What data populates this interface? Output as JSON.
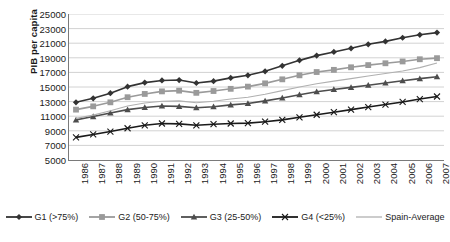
{
  "chart_data": {
    "type": "line",
    "title": "",
    "xlabel": "",
    "ylabel": "PIB per capita",
    "ylim": [
      5000,
      25000
    ],
    "ytick_step": 2000,
    "yticks": [
      5000,
      7000,
      9000,
      11000,
      13000,
      15000,
      17000,
      19000,
      21000,
      23000,
      25000
    ],
    "grid": true,
    "legend_position": "bottom",
    "categories": [
      "1986",
      "1987",
      "1988",
      "1989",
      "1990",
      "1991",
      "1992",
      "1993",
      "1994",
      "1995",
      "1996",
      "1997",
      "1998",
      "1999",
      "2000",
      "2001",
      "2002",
      "2003",
      "2004",
      "2005",
      "2006",
      "2007"
    ],
    "series": [
      {
        "name": "G1 (>75%)",
        "marker": "diamond",
        "color": "#333333",
        "values": [
          12900,
          13450,
          14150,
          15050,
          15600,
          15900,
          15950,
          15550,
          15800,
          16250,
          16600,
          17150,
          17900,
          18650,
          19300,
          19800,
          20300,
          20850,
          21250,
          21750,
          22150,
          22450
        ]
      },
      {
        "name": "G2 (50-75%)",
        "marker": "square",
        "color": "#9a9a9a",
        "values": [
          11900,
          12350,
          12900,
          13600,
          14050,
          14400,
          14500,
          14200,
          14450,
          14750,
          15050,
          15500,
          16050,
          16600,
          17050,
          17350,
          17700,
          18000,
          18250,
          18500,
          18800,
          18950
        ]
      },
      {
        "name": "G3 (25-50%)",
        "marker": "triangle",
        "color": "#4d4d4d",
        "values": [
          10500,
          10950,
          11450,
          11900,
          12200,
          12400,
          12350,
          12150,
          12300,
          12550,
          12750,
          13100,
          13500,
          13950,
          14350,
          14650,
          14950,
          15250,
          15550,
          15850,
          16150,
          16400
        ]
      },
      {
        "name": "G4 (<25%)",
        "marker": "cross",
        "color": "#1a1a1a",
        "values": [
          8100,
          8500,
          8900,
          9350,
          9750,
          10000,
          9950,
          9750,
          9900,
          10000,
          10050,
          10250,
          10500,
          10850,
          11200,
          11550,
          11900,
          12250,
          12600,
          12950,
          13350,
          13700
        ]
      },
      {
        "name": "Spain-Average",
        "marker": "none",
        "color": "#b0b0b0",
        "values": [
          10700,
          11150,
          11750,
          12400,
          12800,
          13050,
          13100,
          12850,
          13050,
          13350,
          13600,
          14000,
          14500,
          15000,
          15450,
          15800,
          16150,
          16500,
          16850,
          17200,
          17650,
          18300
        ]
      }
    ]
  }
}
